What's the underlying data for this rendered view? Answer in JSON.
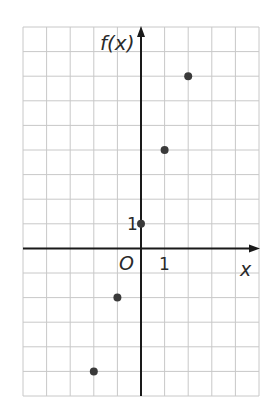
{
  "chart_data": {
    "type": "scatter",
    "title": "",
    "xlabel": "x",
    "ylabel": "f(x)",
    "origin_label": "O",
    "tick_labels": {
      "x": [
        "1"
      ],
      "y": [
        "1"
      ]
    },
    "x_range": [
      -5,
      5
    ],
    "y_range": [
      -6,
      9
    ],
    "grid": true,
    "legend": null,
    "points": [
      {
        "x": -2,
        "y": -5
      },
      {
        "x": -1,
        "y": -2
      },
      {
        "x": 0,
        "y": 1
      },
      {
        "x": 1,
        "y": 4
      },
      {
        "x": 2,
        "y": 7
      }
    ],
    "colors": {
      "grid": "#c8c8c8",
      "axis": "#1a1a1a",
      "point": "#3a3a3a"
    }
  }
}
